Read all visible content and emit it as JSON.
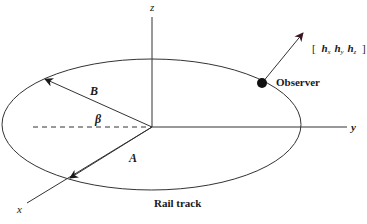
{
  "diagram": {
    "type": "geometry-3d-axes",
    "axes": {
      "x_label": "x",
      "y_label": "y",
      "z_label": "z"
    },
    "vectors": {
      "A_label": "A",
      "B_label": "B",
      "angle_label": "β"
    },
    "observer": {
      "label": "Observer",
      "heading_open": "[",
      "hx": "h",
      "hx_sub": "x",
      "hy": "h",
      "hy_sub": "y",
      "hz": "h",
      "hz_sub": "z",
      "heading_close": "]"
    },
    "track_label": "Rail track",
    "colors": {
      "line": "#333333",
      "arrowhead": "#1a1a1a",
      "observer_arrowhead": "#3a1620",
      "background": "#ffffff"
    }
  }
}
